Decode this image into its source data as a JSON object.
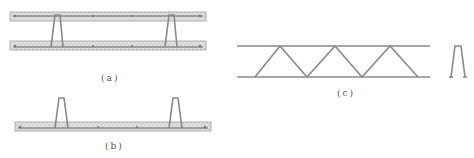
{
  "figure": {
    "panels": [
      {
        "id": "a",
        "caption": "(a)",
        "description": "Two concrete slab layers connected by truss legs (cross-section)"
      },
      {
        "id": "b",
        "caption": "(b)",
        "description": "Single slab layer with truss legs protruding upward"
      },
      {
        "id": "c",
        "caption": "(c)",
        "description": "Steel bar truss elevation with side profile"
      }
    ],
    "colors": {
      "line": "#8a8a8a",
      "slab_fill": "#d4d4d4",
      "slab_border": "#9a9a9a",
      "caption": "#555555"
    }
  }
}
